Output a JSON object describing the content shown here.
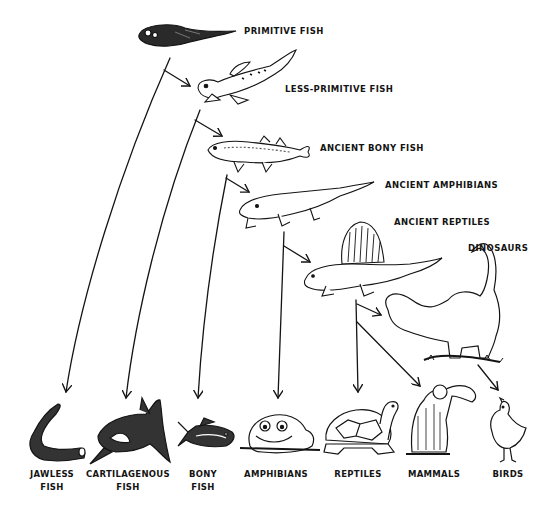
{
  "diagram": {
    "type": "evolutionary-tree",
    "ancestors": [
      {
        "id": "primitive-fish",
        "label": "PRIMITIVE FISH"
      },
      {
        "id": "less-primitive-fish",
        "label": "LESS-PRIMITIVE FISH"
      },
      {
        "id": "ancient-bony-fish",
        "label": "ANCIENT BONY FISH"
      },
      {
        "id": "ancient-amphibians",
        "label": "ANCIENT AMPHIBIANS"
      },
      {
        "id": "ancient-reptiles",
        "label": "ANCIENT REPTILES"
      },
      {
        "id": "dinosaurs",
        "label": "DINOSAURS"
      }
    ],
    "descendants": [
      {
        "id": "jawless-fish",
        "line1": "JAWLESS",
        "line2": "FISH"
      },
      {
        "id": "cartilagenous-fish",
        "line1": "CARTILAGENOUS",
        "line2": "FISH"
      },
      {
        "id": "bony-fish",
        "line1": "BONY",
        "line2": "FISH"
      },
      {
        "id": "amphibians",
        "line1": "AMPHIBIANS",
        "line2": ""
      },
      {
        "id": "reptiles",
        "line1": "REPTILES",
        "line2": ""
      },
      {
        "id": "mammals",
        "line1": "MAMMALS",
        "line2": ""
      },
      {
        "id": "birds",
        "line1": "BIRDS",
        "line2": ""
      }
    ],
    "edges": [
      {
        "from": "primitive-fish",
        "to": "less-primitive-fish"
      },
      {
        "from": "primitive-fish",
        "to": "jawless-fish"
      },
      {
        "from": "less-primitive-fish",
        "to": "ancient-bony-fish"
      },
      {
        "from": "less-primitive-fish",
        "to": "cartilagenous-fish"
      },
      {
        "from": "ancient-bony-fish",
        "to": "ancient-amphibians"
      },
      {
        "from": "ancient-bony-fish",
        "to": "bony-fish"
      },
      {
        "from": "ancient-amphibians",
        "to": "ancient-reptiles"
      },
      {
        "from": "ancient-amphibians",
        "to": "amphibians"
      },
      {
        "from": "ancient-reptiles",
        "to": "dinosaurs"
      },
      {
        "from": "ancient-reptiles",
        "to": "reptiles"
      },
      {
        "from": "ancient-reptiles",
        "to": "mammals"
      },
      {
        "from": "dinosaurs",
        "to": "birds"
      }
    ],
    "colors": {
      "ink": "#141414",
      "background": "#ffffff"
    }
  }
}
